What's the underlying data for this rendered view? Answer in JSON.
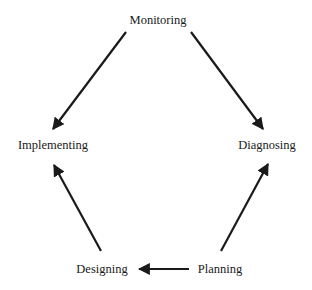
{
  "diagram": {
    "type": "cycle",
    "nodes": {
      "monitoring": {
        "label": "Monitoring",
        "x": 158,
        "y": 20
      },
      "implementing": {
        "label": "Implementing",
        "x": 53,
        "y": 145
      },
      "diagnosing": {
        "label": "Diagnosing",
        "x": 267,
        "y": 145
      },
      "designing": {
        "label": "Designing",
        "x": 102,
        "y": 269
      },
      "planning": {
        "label": "Planning",
        "x": 220,
        "y": 269
      }
    },
    "edges": [
      {
        "from": "Monitoring",
        "to": "Implementing"
      },
      {
        "from": "Monitoring",
        "to": "Diagnosing"
      },
      {
        "from": "Planning",
        "to": "Diagnosing"
      },
      {
        "from": "Planning",
        "to": "Designing"
      },
      {
        "from": "Designing",
        "to": "Implementing"
      }
    ],
    "colors": {
      "line": "#1a1a1a",
      "text": "#1a1a1a",
      "background": "#ffffff"
    }
  }
}
